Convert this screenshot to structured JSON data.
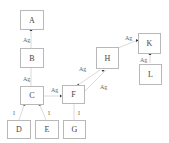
{
  "diagram": {
    "nodes": [
      {
        "id": "A",
        "label": "A"
      },
      {
        "id": "B",
        "label": "B"
      },
      {
        "id": "C",
        "label": "C"
      },
      {
        "id": "D",
        "label": "D"
      },
      {
        "id": "E",
        "label": "E"
      },
      {
        "id": "F",
        "label": "F"
      },
      {
        "id": "G",
        "label": "G"
      },
      {
        "id": "H",
        "label": "H"
      },
      {
        "id": "K",
        "label": "K"
      },
      {
        "id": "L",
        "label": "L"
      }
    ],
    "edges": [
      {
        "from": "B",
        "to": "A",
        "label": "Ag"
      },
      {
        "from": "C",
        "to": "B",
        "label": "Ag"
      },
      {
        "from": "D",
        "to": "C",
        "label": "I"
      },
      {
        "from": "E",
        "to": "C",
        "label": "I"
      },
      {
        "from": "C",
        "to": "F",
        "label": "Ag"
      },
      {
        "from": "G",
        "to": "F",
        "label": "I"
      },
      {
        "from": "F",
        "to": "H",
        "label": "Ag"
      },
      {
        "from": "F",
        "to": "H",
        "label": "Ag"
      },
      {
        "from": "H",
        "to": "K",
        "label": "Ag"
      },
      {
        "from": "L",
        "to": "K",
        "label": "Ag"
      }
    ]
  }
}
